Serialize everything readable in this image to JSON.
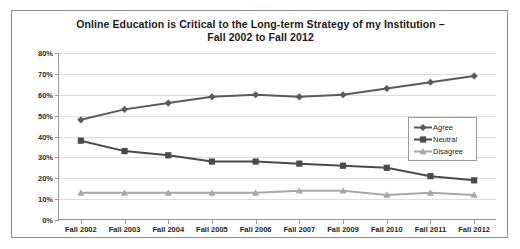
{
  "page": {
    "top_bleed_text": ". . ."
  },
  "chart_data": {
    "type": "line",
    "title": "Online Education is Critical to the Long-term Strategy of my Institution –",
    "title_line2": "Fall 2002 to Fall 2012",
    "xlabel": "",
    "ylabel": "",
    "ylim": [
      0,
      80
    ],
    "grid": true,
    "legend_position": "inside-upper-right",
    "categories": [
      "Fall 2002",
      "Fall 2003",
      "Fall 2004",
      "Fall 2005",
      "Fall 2006",
      "Fall 2007",
      "Fall 2009",
      "Fall 2010",
      "Fall 2011",
      "Fall 2012"
    ],
    "ytick_labels": [
      "80%",
      "70%",
      "60%",
      "50%",
      "40%",
      "30%",
      "20%",
      "10%",
      "0%"
    ],
    "ytick_values": [
      80,
      70,
      60,
      50,
      40,
      30,
      20,
      10,
      0
    ],
    "series": [
      {
        "name": "Agree",
        "marker": "diamond",
        "color": "#5a5a5a",
        "values": [
          48,
          53,
          56,
          59,
          60,
          59,
          60,
          63,
          66,
          69
        ]
      },
      {
        "name": "Neutral",
        "marker": "square",
        "color": "#4a4a4a",
        "values": [
          38,
          33,
          31,
          28,
          28,
          27,
          26,
          25,
          21,
          19
        ]
      },
      {
        "name": "Disagree",
        "marker": "triangle",
        "color": "#a8a8a8",
        "values": [
          13,
          13,
          13,
          13,
          13,
          14,
          14,
          12,
          13,
          12
        ]
      }
    ]
  }
}
